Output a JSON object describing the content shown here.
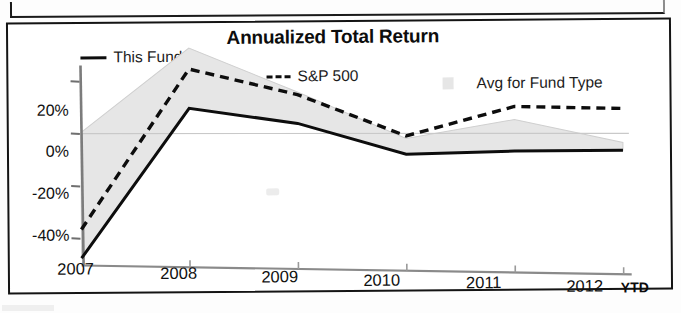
{
  "chart_data": {
    "type": "line",
    "title": "Annualized Total Return",
    "xlabel": "",
    "ylabel": "",
    "x": [
      "2007",
      "2008",
      "2009",
      "2010",
      "2011",
      "2012"
    ],
    "categories": [
      "2007",
      "2008",
      "2009",
      "2010",
      "2011",
      "2012"
    ],
    "x_axis_note": "YTD",
    "ytick_labels": [
      "20%",
      "0%",
      "-20%",
      "-40%"
    ],
    "ytick_values": [
      20,
      0,
      -20,
      -40
    ],
    "ylim": [
      -50,
      34
    ],
    "grid": false,
    "legend_position": "top",
    "series": [
      {
        "name": "This Fund",
        "style": "solid",
        "color": "#0d0d0d",
        "values": [
          -48,
          9,
          3,
          -9,
          -8,
          -8
        ]
      },
      {
        "name": "S&P 500",
        "style": "dashed",
        "color": "#0d0d0d",
        "values": [
          -37,
          24,
          14,
          -2,
          9,
          8
        ]
      },
      {
        "name": "Avg for Fund Type",
        "style": "area",
        "color": "#e6e6e6",
        "upper": [
          0,
          32,
          15,
          -3,
          4,
          -5
        ],
        "lower": [
          -48,
          9,
          3,
          -9,
          -8,
          -8
        ]
      }
    ]
  },
  "chart": {
    "title": "Annualized Total Return",
    "legend": [
      {
        "label": "This Fund",
        "marker": "solid-line-swatch"
      },
      {
        "label": "S&P 500",
        "marker": "dashed-line-swatch"
      },
      {
        "label": "Avg for Fund Type",
        "marker": "gray-area-swatch"
      }
    ],
    "y_axis": {
      "ticks": [
        "20%",
        "0%",
        "-20%",
        "-40%"
      ]
    },
    "x_axis": {
      "ticks": [
        "2007",
        "2008",
        "2009",
        "2010",
        "2011",
        "2012"
      ],
      "suffix": "YTD"
    },
    "colors": {
      "line": "#0d0d0d",
      "area": "#e6e6e6",
      "axis": "#7a7a7a",
      "border": "#141414"
    }
  }
}
